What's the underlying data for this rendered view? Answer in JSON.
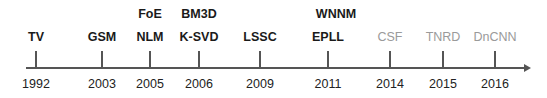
{
  "axis": {
    "color": "#555555"
  },
  "events": [
    {
      "year": "1992",
      "x": 36,
      "methods": [
        "TV"
      ],
      "style": "dark"
    },
    {
      "year": "2003",
      "x": 102,
      "methods": [
        "GSM"
      ],
      "style": "dark"
    },
    {
      "year": "2005",
      "x": 150,
      "methods": [
        "NLM",
        "FoE"
      ],
      "style": "dark"
    },
    {
      "year": "2006",
      "x": 199,
      "methods": [
        "K-SVD",
        "BM3D"
      ],
      "style": "dark"
    },
    {
      "year": "2009",
      "x": 260,
      "methods": [
        "LSSC"
      ],
      "style": "dark"
    },
    {
      "year": "2011",
      "x": 328,
      "methods": [
        "EPLL",
        "WNNM"
      ],
      "style": "dark"
    },
    {
      "year": "2014",
      "x": 390,
      "methods": [
        "CSF"
      ],
      "style": "gray"
    },
    {
      "year": "2015",
      "x": 443,
      "methods": [
        "TNRD"
      ],
      "style": "gray"
    },
    {
      "year": "2016",
      "x": 495,
      "methods": [
        "DnCNN"
      ],
      "style": "gray"
    }
  ],
  "colors": {
    "dark_text": "#1a1a1a",
    "gray_text": "#9a9a9a"
  }
}
